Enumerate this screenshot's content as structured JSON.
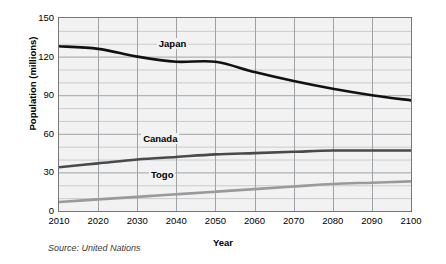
{
  "chart_data": {
    "type": "line",
    "title": "",
    "xlabel": "Year",
    "ylabel": "Population (millions)",
    "xlim": [
      2010,
      2100
    ],
    "ylim": [
      0,
      150
    ],
    "ytick_labels": [
      "150",
      "120",
      "90",
      "60",
      "30",
      "0"
    ],
    "ytick_values": [
      150,
      120,
      90,
      60,
      30,
      0
    ],
    "xtick_labels": [
      "2010",
      "2020",
      "2030",
      "2040",
      "2050",
      "2060",
      "2070",
      "2080",
      "2090",
      "2100"
    ],
    "xtick_values": [
      2010,
      2020,
      2030,
      2040,
      2050,
      2060,
      2070,
      2080,
      2090,
      2100
    ],
    "grid": "major vertical at each decade, major and minor horizontal every 10 million",
    "minor_y_step": 10,
    "legend": "inline labels on plot",
    "x": [
      2010,
      2020,
      2030,
      2040,
      2050,
      2060,
      2070,
      2080,
      2090,
      2100
    ],
    "series": [
      {
        "name": "Japan",
        "color": "#111111",
        "label_x": 2035,
        "label_y": 130,
        "values": [
          128,
          126,
          120,
          116,
          116,
          108,
          101,
          95,
          90,
          86
        ]
      },
      {
        "name": "Canada",
        "color": "#4a4a4a",
        "label_x": 2031,
        "label_y": 56,
        "values": [
          34,
          37,
          40,
          42,
          44,
          45,
          46,
          47,
          47,
          47
        ]
      },
      {
        "name": "Togo",
        "color": "#9a9a9a",
        "label_x": 2033,
        "label_y": 28,
        "values": [
          7,
          9,
          11,
          13,
          15,
          17,
          19,
          21,
          22,
          23
        ]
      }
    ],
    "source_note": "Source: United Nations",
    "background_color": "#f2f2f2",
    "frame_color": "#777777",
    "gridline_color": "#9fa3a8"
  }
}
